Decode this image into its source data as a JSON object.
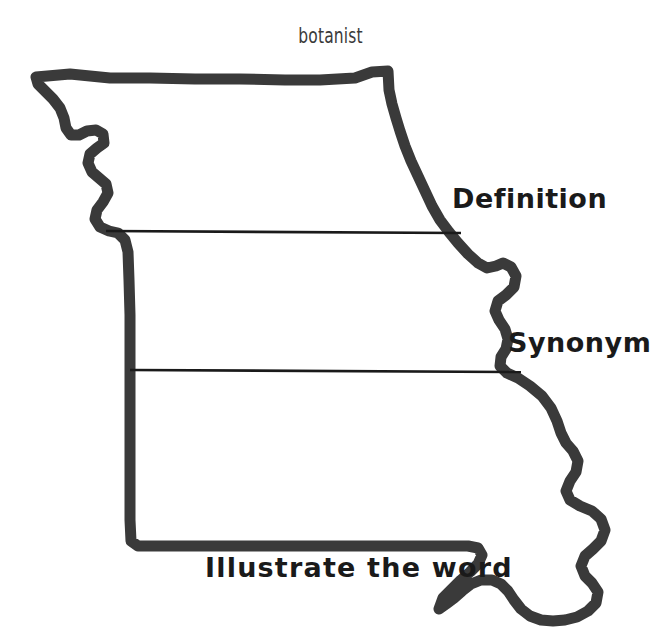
{
  "worksheet": {
    "title": "botanist",
    "map_shape": "missouri-state-outline",
    "background_color": "#ffffff",
    "outline_color": "#3a3a3a",
    "divider_color": "#1a1a1a",
    "text_color": "#1a1a1a",
    "sections": [
      {
        "id": "definition",
        "label": "Definition"
      },
      {
        "id": "synonym",
        "label": "Synonym"
      },
      {
        "id": "illustrate",
        "label": "Illustrate the word"
      }
    ],
    "dividers": [
      {
        "id": "divider-definition",
        "x1": 106,
        "y1": 231,
        "x2": 461,
        "y2": 233
      },
      {
        "id": "divider-synonym",
        "x1": 130,
        "y1": 370,
        "x2": 521,
        "y2": 372
      }
    ]
  }
}
